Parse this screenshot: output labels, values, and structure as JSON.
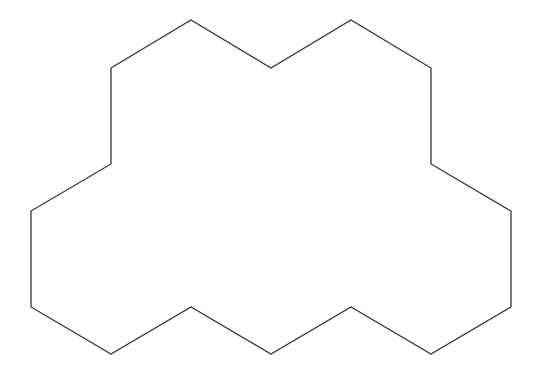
{
  "diagram": {
    "type": "polygon-outline",
    "shape": "three-hexagon cluster outline",
    "stroke_color": "#333333",
    "fill_color": "#ffffff",
    "stroke_width": 1.3,
    "vertices": [
      [
        111,
        68
      ],
      [
        191,
        20
      ],
      [
        271,
        68
      ],
      [
        351,
        20
      ],
      [
        431,
        68
      ],
      [
        431,
        164
      ],
      [
        511,
        211
      ],
      [
        511,
        307
      ],
      [
        431,
        354
      ],
      [
        351,
        307
      ],
      [
        271,
        354
      ],
      [
        191,
        307
      ],
      [
        111,
        354
      ],
      [
        31,
        307
      ],
      [
        31,
        211
      ],
      [
        111,
        164
      ]
    ]
  }
}
